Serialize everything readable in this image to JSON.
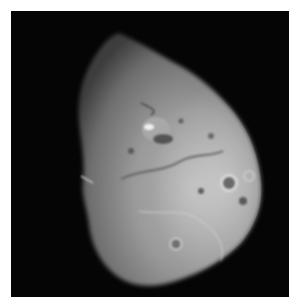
{
  "image": {
    "subject": "comet nucleus in space",
    "description": "Grayscale photograph of an irregular, potato-shaped comet nucleus against a black background, with craters and surface ridges visible",
    "colors": {
      "background": "#050505",
      "surface_light": "#c8c8c8",
      "surface_mid": "#8a8a8a",
      "surface_dark": "#4a4a4a",
      "page": "#ffffff"
    }
  }
}
